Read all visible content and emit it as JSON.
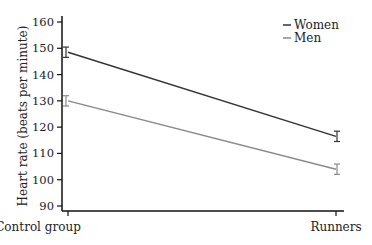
{
  "chart_data": {
    "type": "line",
    "title": "",
    "xlabel": "",
    "ylabel": "Heart rate (beats per minute)",
    "categories": [
      "Control group",
      "Runners"
    ],
    "series": [
      {
        "name": "Women",
        "values": [
          148.5,
          116.5
        ],
        "error": [
          1.2,
          1.2
        ],
        "color": "#333333"
      },
      {
        "name": "Men",
        "values": [
          130,
          104
        ],
        "error": [
          1.2,
          1.2
        ],
        "color": "#8a8a8a"
      }
    ],
    "ylim": [
      90,
      160
    ],
    "yticks": [
      90,
      100,
      110,
      120,
      130,
      140,
      150,
      160
    ],
    "grid": false,
    "legend_position": "top-right"
  }
}
